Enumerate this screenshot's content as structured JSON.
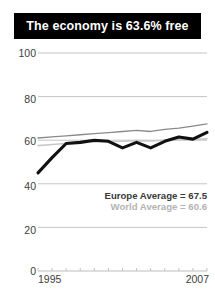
{
  "title": {
    "text": "The economy is 63.6% free"
  },
  "legend": {
    "europe": "Europe Average = 67.5",
    "world": "World Average = 60.6"
  },
  "axis": {
    "y_ticks": [
      "100",
      "80",
      "60",
      "40",
      "20",
      "0"
    ],
    "x_start": "1995",
    "x_end": "2007"
  },
  "colors": {
    "title_bar": "#000000",
    "title_text": "#ffffff",
    "country_line": "#111111",
    "europe_line": "#8a8a8a",
    "world_line": "#c9c9c9",
    "grid": "#bdbdbd",
    "tick_text": "#3d3d3d"
  },
  "chart_data": {
    "type": "line",
    "title": "The economy is 63.6% free",
    "xlabel": "",
    "ylabel": "",
    "xlim": [
      1995,
      2007
    ],
    "ylim": [
      0,
      100
    ],
    "yticks": [
      0,
      20,
      40,
      60,
      80,
      100
    ],
    "grid": true,
    "legend_position": "inside-lower-right",
    "x": [
      1995,
      1996,
      1997,
      1998,
      1999,
      2000,
      2001,
      2002,
      2003,
      2004,
      2005,
      2006,
      2007
    ],
    "series": [
      {
        "name": "Country",
        "color": "#111111",
        "values": [
          45.0,
          52.0,
          58.5,
          59.0,
          60.0,
          59.5,
          56.5,
          59.0,
          56.5,
          59.5,
          61.5,
          60.5,
          63.6
        ]
      },
      {
        "name": "Europe Average",
        "color": "#8a8a8a",
        "label": "Europe Average = 67.5",
        "values": [
          61.0,
          61.5,
          62.0,
          62.5,
          63.0,
          63.5,
          64.0,
          64.5,
          64.0,
          65.0,
          65.5,
          66.5,
          67.5
        ]
      },
      {
        "name": "World Average",
        "color": "#c9c9c9",
        "label": "World Average = 60.6",
        "values": [
          57.5,
          58.0,
          58.5,
          58.8,
          59.2,
          59.4,
          59.5,
          59.8,
          59.6,
          60.0,
          60.2,
          60.4,
          60.6
        ]
      }
    ]
  }
}
